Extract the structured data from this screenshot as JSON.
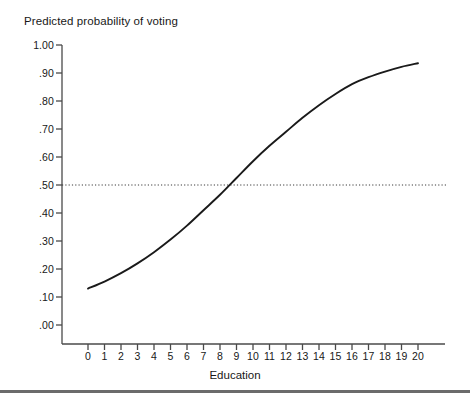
{
  "chart_data": {
    "type": "line",
    "title": "Predicted probability of voting",
    "xlabel": "Education",
    "ylabel": "",
    "xlim": [
      0,
      20
    ],
    "ylim": [
      0.0,
      1.0
    ],
    "grid": false,
    "legend": null,
    "x_ticks": [
      "0",
      "1",
      "2",
      "3",
      "4",
      "5",
      "6",
      "7",
      "8",
      "9",
      "10",
      "11",
      "12",
      "13",
      "14",
      "15",
      "16",
      "17",
      "18",
      "19",
      "20"
    ],
    "x_tick_values": [
      0,
      1,
      2,
      3,
      4,
      5,
      6,
      7,
      8,
      9,
      10,
      11,
      12,
      13,
      14,
      15,
      16,
      17,
      18,
      19,
      20
    ],
    "y_ticks": [
      "1.00",
      ".90",
      ".80",
      ".70",
      ".60",
      ".50",
      ".40",
      ".30",
      ".20",
      ".10",
      ".00"
    ],
    "y_tick_values": [
      1.0,
      0.9,
      0.8,
      0.7,
      0.6,
      0.5,
      0.4,
      0.3,
      0.2,
      0.1,
      0.0
    ],
    "series": [
      {
        "name": "Predicted probability of voting",
        "style": "solid",
        "color": "#1a1a1a",
        "x": [
          0,
          1,
          2,
          3,
          4,
          5,
          6,
          7,
          8,
          9,
          10,
          11,
          12,
          13,
          14,
          15,
          16,
          17,
          18,
          19,
          20
        ],
        "values": [
          0.13,
          0.155,
          0.185,
          0.22,
          0.26,
          0.305,
          0.355,
          0.41,
          0.465,
          0.525,
          0.585,
          0.64,
          0.69,
          0.74,
          0.785,
          0.825,
          0.86,
          0.885,
          0.905,
          0.922,
          0.935
        ]
      }
    ],
    "reference_lines": [
      {
        "name": "half-probability-line",
        "orientation": "horizontal",
        "value": 0.5,
        "style": "dotted",
        "color": "#3a3a3a"
      }
    ],
    "annotations": {
      "crossing_point": {
        "x": 8.35,
        "y": 0.5
      }
    }
  },
  "axes": {
    "x_axis_name": "education-axis",
    "y_axis_name": "probability-axis"
  },
  "footer": {
    "rule": ""
  }
}
